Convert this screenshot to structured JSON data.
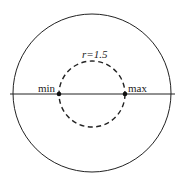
{
  "diagram": {
    "outer_circle": {
      "cx": 92,
      "cy": 93,
      "r": 79
    },
    "axis_line": {
      "x1": 10,
      "x2": 175,
      "y": 94
    },
    "inner_circle": {
      "cx": 92,
      "cy": 94,
      "r": 33,
      "style": "dashed"
    },
    "points": [
      {
        "name": "min",
        "label": "min",
        "x": 59,
        "y": 94
      },
      {
        "name": "max",
        "label": "max",
        "x": 125,
        "y": 94
      }
    ],
    "radius_label": "r=1.5",
    "colors": {
      "stroke": "#222222",
      "background": "#ffffff"
    }
  }
}
